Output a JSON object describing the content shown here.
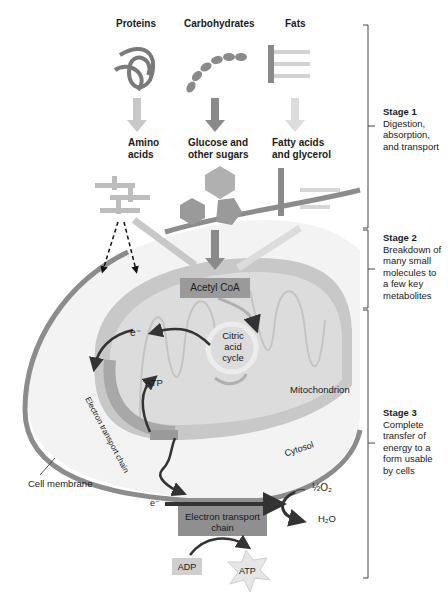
{
  "sources": {
    "proteins": "Proteins",
    "carbohydrates": "Carbohydrates",
    "fats": "Fats"
  },
  "products": {
    "amino_acids_1": "Amino",
    "amino_acids_2": "acids",
    "glucose_1": "Glucose and",
    "glucose_2": "other sugars",
    "fatty_1": "Fatty acids",
    "fatty_2": "and glycerol"
  },
  "stages": [
    {
      "title": "Stage 1",
      "desc": "Digestion,\nabsorption,\nand transport"
    },
    {
      "title": "Stage 2",
      "desc": "Breakdown of\nmany small\nmolecules to\na few key\nmetabolites"
    },
    {
      "title": "Stage 3",
      "desc": "Complete\ntransfer of\nenergy to a\nform usable\nby cells"
    }
  ],
  "mito": {
    "acetyl_coa": "Acetyl CoA",
    "citric_1": "Citric",
    "citric_2": "acid",
    "citric_3": "cycle",
    "electron": "e⁻",
    "atp": "ATP",
    "etc_curved": "Electron transport chain",
    "mitochondrion": "Mitochondrion",
    "cytosol": "Cytosol",
    "cell_membrane": "Cell membrane"
  },
  "bottom": {
    "electron": "e⁻",
    "etc_1": "Electron transport",
    "etc_2": "chain",
    "oxygen": "½O₂",
    "water": "H₂O",
    "adp": "ADP",
    "atp": "ATP"
  },
  "colors": {
    "membrane": "#8c8c8c",
    "mito_outer": "#c8c8c8",
    "mito_inner": "#dcdcdc",
    "acetyl_box": "#9a9a9a",
    "etc_box": "#8f8f8f",
    "arrow_dark": "#3a3a3a"
  }
}
